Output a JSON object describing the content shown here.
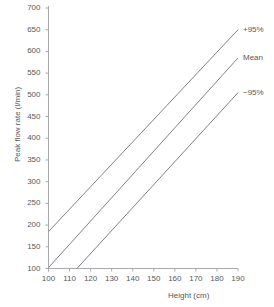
{
  "chart_data": {
    "type": "line",
    "title": "",
    "xlabel": "Height (cm)",
    "ylabel": "Peak flow rate (l/min)",
    "xlim": [
      100,
      190
    ],
    "ylim": [
      100,
      700
    ],
    "xticks": [
      100,
      110,
      120,
      130,
      140,
      150,
      160,
      170,
      180,
      190
    ],
    "yticks": [
      100,
      150,
      200,
      250,
      300,
      350,
      400,
      450,
      500,
      550,
      600,
      650,
      700
    ],
    "grid": false,
    "legend_position": "right-inline",
    "line_color": "#808285",
    "axis_color": "#a7a9ac",
    "text_color": "#58595b",
    "series": [
      {
        "name": "+95%",
        "x": [
          100,
          190
        ],
        "y": [
          185,
          650
        ],
        "label": "+95%"
      },
      {
        "name": "Mean",
        "x": [
          100,
          190
        ],
        "y": [
          102,
          585
        ],
        "label": "Mean"
      },
      {
        "name": "−95%",
        "x": [
          113.5,
          190
        ],
        "y": [
          100,
          505
        ],
        "label": "−95%"
      }
    ]
  }
}
